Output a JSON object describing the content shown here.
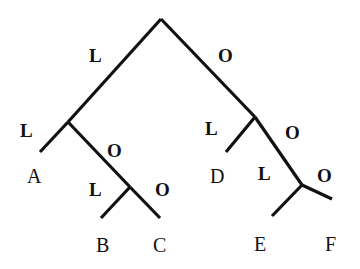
{
  "diagram": {
    "type": "binary-tree",
    "colors": {
      "line": "#111111",
      "background": "#ffffff"
    },
    "nodes": [
      {
        "id": "root"
      },
      {
        "id": "n1"
      },
      {
        "id": "n2"
      },
      {
        "id": "n3"
      },
      {
        "id": "n4"
      },
      {
        "id": "A",
        "label": "A"
      },
      {
        "id": "B",
        "label": "B"
      },
      {
        "id": "C",
        "label": "C"
      },
      {
        "id": "D",
        "label": "D"
      },
      {
        "id": "E",
        "label": "E"
      },
      {
        "id": "F",
        "label": "F"
      }
    ],
    "edges": [
      {
        "from": "root",
        "to": "n1",
        "label": "L"
      },
      {
        "from": "root",
        "to": "n3",
        "label": "O"
      },
      {
        "from": "n1",
        "to": "A",
        "label": "L"
      },
      {
        "from": "n1",
        "to": "n2",
        "label": "O"
      },
      {
        "from": "n2",
        "to": "B",
        "label": "L"
      },
      {
        "from": "n2",
        "to": "C",
        "label": "O"
      },
      {
        "from": "n3",
        "to": "D",
        "label": "L"
      },
      {
        "from": "n3",
        "to": "n4",
        "label": "O"
      },
      {
        "from": "n4",
        "to": "E",
        "label": "L"
      },
      {
        "from": "n4",
        "to": "F",
        "label": "O"
      }
    ]
  }
}
